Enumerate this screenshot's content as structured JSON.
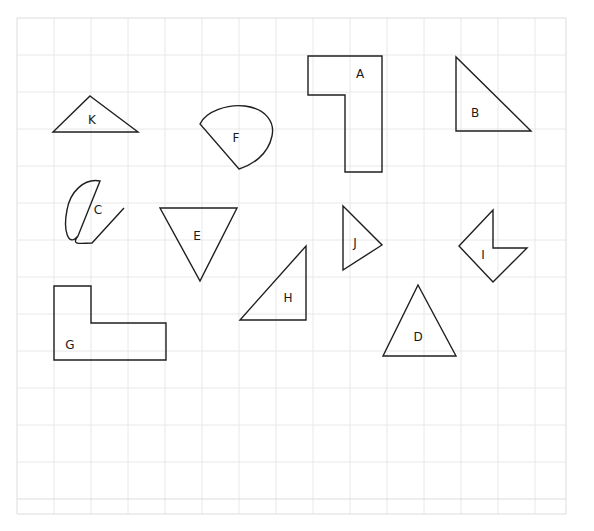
{
  "canvas": {
    "width": 594,
    "height": 531,
    "background_color": "#ffffff",
    "stroke_color": "#1f1f1f",
    "label_color": "#1a1a1a"
  },
  "grid": {
    "visible": true,
    "color": "#e0e0e0",
    "spacing": 37,
    "left": 17,
    "top": 18,
    "right": 566,
    "bottom": 514,
    "columns": 15,
    "rows": 14
  },
  "shapes": [
    {
      "id": "A",
      "label": "A",
      "type": "l-polygon",
      "label_x": 360,
      "label_y": 74,
      "points": "308,56 382,56 382,172 345,172 345,95 308,95"
    },
    {
      "id": "B",
      "label": "B",
      "type": "right-triangle",
      "label_x": 475,
      "label_y": 113,
      "points": "456,57 456,131 531,131"
    },
    {
      "id": "C",
      "label": "C",
      "type": "blob",
      "label_x": 98,
      "label_y": 210,
      "path": "M 100,181 C 84,178 70,192 67,210 C 63,230 68,248 78,236 L 78,236 C 70,246 82,243 92,243 L 124,208 L 92,243 C 82,243 70,246 78,236 Z"
    },
    {
      "id": "D",
      "label": "D",
      "type": "triangle",
      "label_x": 418,
      "label_y": 337,
      "points": "418,285 456,356 383,356"
    },
    {
      "id": "E",
      "label": "E",
      "type": "inverted-triangle",
      "label_x": 197,
      "label_y": 236,
      "points": "160,208 237,208 200,281"
    },
    {
      "id": "F",
      "label": "F",
      "type": "blob",
      "label_x": 236,
      "label_y": 138,
      "path": "M 200,124 C 206,111 228,104 245,106 C 266,109 275,122 272,136 C 268,155 252,165 239,169 L 200,124 Z"
    },
    {
      "id": "G",
      "label": "G",
      "type": "l-polygon",
      "label_x": 70,
      "label_y": 345,
      "points": "54,286 91,286 91,323 166,323 166,360 54,360"
    },
    {
      "id": "H",
      "label": "H",
      "type": "right-triangle",
      "label_x": 288,
      "label_y": 298,
      "points": "306,246 306,320 240,320"
    },
    {
      "id": "I",
      "label": "I",
      "type": "arrow-polygon",
      "label_x": 483,
      "label_y": 255,
      "points": "493,210 493,248 527,248 493,282 459,246"
    },
    {
      "id": "J",
      "label": "J",
      "type": "triangle",
      "label_x": 355,
      "label_y": 243,
      "points": "343,206 382,245 343,270"
    },
    {
      "id": "K",
      "label": "K",
      "type": "triangle",
      "label_x": 92,
      "label_y": 120,
      "points": "90,96 138,132 53,132"
    }
  ]
}
